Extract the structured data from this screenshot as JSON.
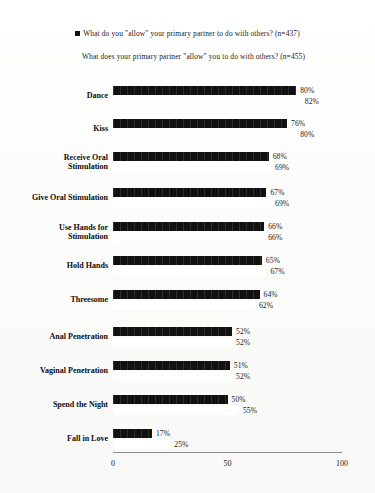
{
  "legend": {
    "series1": "What do you \"allow\" your primary partner to do with others? (n=437)",
    "series2": "What does your primary partner \"allow\" you to do with others? (n=455)",
    "marker_series1": "filled-square-marker",
    "marker_series2": "white-square-marker"
  },
  "axis": {
    "ticks": [
      "0",
      "50",
      "100"
    ],
    "tick_values": [
      0,
      50,
      100
    ],
    "xmin": 0,
    "xmax": 100
  },
  "chart_data": {
    "type": "bar",
    "orientation": "horizontal",
    "title": "",
    "subtitle": "",
    "xlabel": "",
    "ylabel": "",
    "xlim": [
      0,
      100
    ],
    "grid": false,
    "legend_position": "top",
    "categories": [
      "Dance",
      "Kiss",
      "Receive Oral\nStimulation",
      "Give Oral Stimulation",
      "Use Hands for\nStimulation",
      "Hold Hands",
      "Threesome",
      "Anal Penetration",
      "Vaginal Penetration",
      "Spend the Night",
      "Fall in Love"
    ],
    "series": [
      {
        "name": "What do you \"allow\" your primary partner to do with others? (n=437)",
        "color": "#111111",
        "values": [
          80,
          76,
          68,
          67,
          66,
          65,
          64,
          52,
          51,
          50,
          17
        ],
        "labels": [
          "80%",
          "76%",
          "68%",
          "67%",
          "66%",
          "65%",
          "64%",
          "52%",
          "51%",
          "50%",
          "17%"
        ]
      },
      {
        "name": "What does your primary partner \"allow\" you to do with others? (n=455)",
        "color": "#ffffff",
        "values": [
          82,
          80,
          69,
          69,
          66,
          67,
          62,
          52,
          52,
          55,
          25
        ],
        "labels": [
          "82%",
          "80%",
          "69%",
          "69%",
          "66%",
          "67%",
          "62%",
          "52%",
          "52%",
          "55%",
          "25%"
        ]
      }
    ]
  }
}
